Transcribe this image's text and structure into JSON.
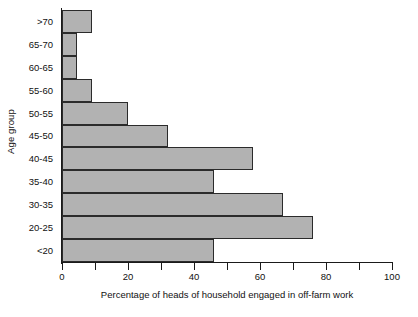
{
  "chart_data": {
    "type": "bar",
    "orientation": "horizontal",
    "title": "",
    "xlabel": "Percentage of heads of household engaged in off-farm work",
    "ylabel": "Age group",
    "categories": [
      "<20",
      "20-25",
      "25-30",
      "30-35",
      "35-40",
      "40-45",
      "45-50",
      "50-55",
      "55-60",
      "60-65",
      "65-70",
      ">70"
    ],
    "values": [
      46,
      76,
      67,
      67,
      46,
      58,
      32,
      20,
      9,
      4.5,
      4.5,
      9
    ],
    "bars": [
      {
        "category": ">70",
        "value": 9
      },
      {
        "category": "65-70",
        "value": 4.5
      },
      {
        "category": "60-65",
        "value": 4.5
      },
      {
        "category": "55-60",
        "value": 9
      },
      {
        "category": "50-55",
        "value": 20
      },
      {
        "category": "45-50",
        "value": 32
      },
      {
        "category": "40-45",
        "value": 58
      },
      {
        "category": "35-40",
        "value": 46
      },
      {
        "category": "30-35",
        "value": 67
      },
      {
        "category": "20-25",
        "value": 76
      },
      {
        "category": "<20",
        "value": 46
      }
    ],
    "xlim": [
      0,
      100
    ],
    "xticks": [
      0,
      20,
      40,
      60,
      80,
      100
    ],
    "xtick_labels": [
      "0",
      "20",
      "40",
      "60",
      "80",
      "100"
    ],
    "xminorticks": [
      10,
      30,
      50,
      70,
      90
    ],
    "ytick_labels": [
      ">70",
      "65-70",
      "60-65",
      "55-60",
      "50-55",
      "45-50",
      "40-45",
      "35-40",
      "30-35",
      "20-25",
      "<20"
    ],
    "grid": false,
    "legend": false,
    "colors": {
      "bar_fill": "#b2b2b2",
      "bar_edge": "#2b2b2b",
      "axis": "#1a1a1a",
      "text": "#111111",
      "background": "#ffffff"
    }
  }
}
